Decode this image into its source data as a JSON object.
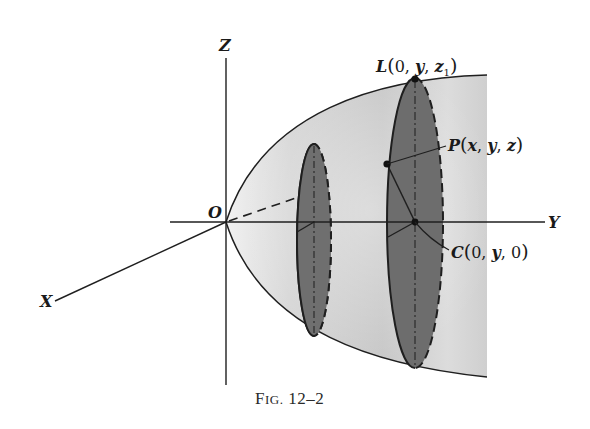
{
  "figure": {
    "caption": "Fig. 12–2",
    "caption_small_caps_prefix": "F",
    "caption_small_caps_rest": "IG.",
    "caption_number": " 12–2"
  },
  "axes": {
    "x_label": "X",
    "y_label": "Y",
    "z_label": "Z",
    "origin_label": "O"
  },
  "points": {
    "L": {
      "name": "L",
      "open": "(",
      "coords_parts": [
        "0",
        ", ",
        "y",
        ", ",
        "z",
        "1",
        ")"
      ],
      "text": "L(0, y, z1)"
    },
    "P": {
      "name": "P",
      "text": "P(x, y, z)",
      "inner": "(x, y, z)"
    },
    "C": {
      "name": "C",
      "text": "C(0, y, 0)"
    }
  },
  "colors": {
    "solid_light": "#d9d9d9",
    "solid_mid": "#bdbdbd",
    "disk_fill": "#6f6f6f",
    "line": "#1f1f1f"
  }
}
